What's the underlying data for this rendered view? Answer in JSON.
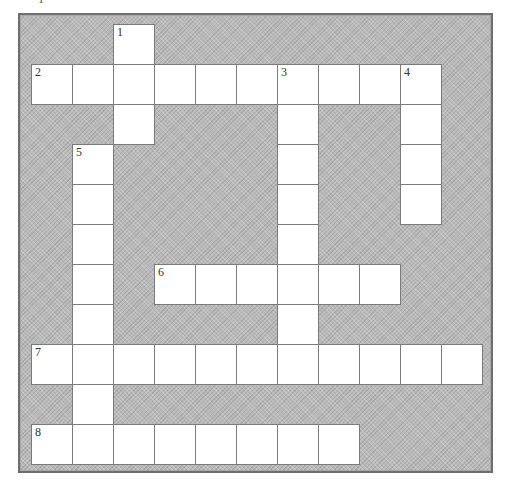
{
  "puzzle": {
    "top_fragment": "1",
    "grid": {
      "origin_x": 32,
      "origin_y": 25,
      "cell_w": 41,
      "cell_h": 40,
      "cols": 11,
      "rows": 11
    },
    "colors": {
      "background": "#b9b9b9",
      "cell": "#ffffff",
      "cell_border": "#7a7a7a",
      "frame_border": "#6e6e6e"
    },
    "entries": [
      {
        "number": "1",
        "direction": "down",
        "col": 2,
        "row": 0,
        "length": 3
      },
      {
        "number": "2",
        "direction": "across",
        "col": 0,
        "row": 1,
        "length": 10
      },
      {
        "number": "3",
        "direction": "down",
        "col": 6,
        "row": 1,
        "length": 8
      },
      {
        "number": "4",
        "direction": "down",
        "col": 9,
        "row": 1,
        "length": 4
      },
      {
        "number": "5",
        "direction": "down",
        "col": 1,
        "row": 3,
        "length": 8
      },
      {
        "number": "6",
        "direction": "across",
        "col": 3,
        "row": 6,
        "length": 6
      },
      {
        "number": "7",
        "direction": "across",
        "col": 0,
        "row": 8,
        "length": 11
      },
      {
        "number": "8",
        "direction": "across",
        "col": 0,
        "row": 10,
        "length": 8
      }
    ]
  }
}
